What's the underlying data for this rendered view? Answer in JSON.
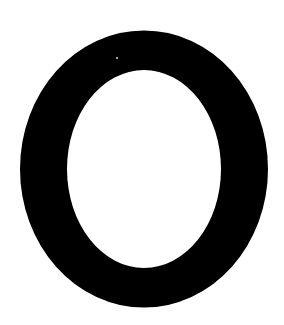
{
  "image": {
    "width": 284,
    "height": 325,
    "background": "#ffffff"
  },
  "glyph": {
    "character": "O",
    "color": "#000000",
    "outer": {
      "cx": 144,
      "cy": 169,
      "rx": 124,
      "ry": 138.5
    },
    "inner": {
      "cx": 144,
      "cy": 169,
      "rx": 77,
      "ry": 99
    },
    "speck": {
      "cx": 117,
      "cy": 58,
      "r": 1,
      "color": "#dddddd"
    }
  }
}
